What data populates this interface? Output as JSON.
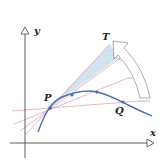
{
  "diagram": {
    "labels": {
      "y_axis": "y",
      "x_axis": "x",
      "point_p": "P",
      "point_q": "Q",
      "tangent": "T"
    },
    "colors": {
      "curve": "#4a6fa8",
      "secants": "#d79aa8",
      "tangent_fill": "#a9c8de",
      "axes": "#333333",
      "arrow": "#777777"
    }
  }
}
